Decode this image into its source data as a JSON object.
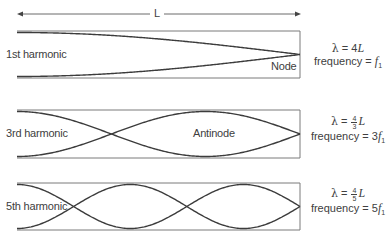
{
  "diagram": {
    "title_length_label": "L",
    "colors": {
      "tube": "#7a7a7a",
      "wave": "#3c3c3c",
      "arrow": "#6a6a6a",
      "text": "#404040"
    },
    "tube": {
      "x_left": 17,
      "x_right": 300
    },
    "harmonics": [
      {
        "label": "1st harmonic",
        "annotation": "Node",
        "y_top": 31,
        "y_bottom": 78,
        "n": 1,
        "wavelength": {
          "symbol": "λ",
          "equals": "=",
          "coef": "4",
          "var": "L"
        },
        "frequency": {
          "label": "frequency",
          "equals": "=",
          "coef": "",
          "var": "f",
          "sub": "1"
        }
      },
      {
        "label": "3rd harmonic",
        "annotation": "Antinode",
        "y_top": 110,
        "y_bottom": 158,
        "n": 3,
        "wavelength": {
          "symbol": "λ",
          "equals": "=",
          "num": "4",
          "den": "3",
          "var": "L"
        },
        "frequency": {
          "label": "frequency",
          "equals": "=",
          "coef": "3",
          "var": "f",
          "sub": "1"
        }
      },
      {
        "label": "5th harmonic",
        "annotation": "",
        "y_top": 183,
        "y_bottom": 230,
        "n": 5,
        "wavelength": {
          "symbol": "λ",
          "equals": "=",
          "num": "4",
          "den": "5",
          "var": "L"
        },
        "frequency": {
          "label": "frequency",
          "equals": "=",
          "coef": "5",
          "var": "f",
          "sub": "1"
        }
      }
    ]
  }
}
